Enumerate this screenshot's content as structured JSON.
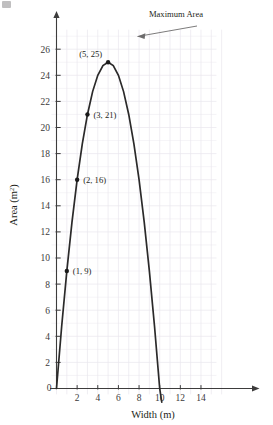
{
  "chart_data": {
    "type": "line",
    "title": "",
    "xlabel": "Width (m)",
    "ylabel": "Area (m²)",
    "ylabel_base": "Area (m",
    "ylabel_sup": "2",
    "ylabel_close": ")",
    "xlim": [
      0,
      15.5
    ],
    "ylim": [
      0,
      27.5
    ],
    "grid": true,
    "legend": "none",
    "equation": "A = -(w - 5)^2 + 25",
    "x_ticks": [
      0,
      2,
      4,
      6,
      8,
      10,
      12,
      14
    ],
    "x_tick_labels": [
      "0",
      "2",
      "4",
      "6",
      "8",
      "10",
      "12",
      "14"
    ],
    "y_ticks": [
      0,
      2,
      4,
      6,
      8,
      10,
      12,
      14,
      16,
      18,
      20,
      22,
      24,
      26
    ],
    "y_tick_labels": [
      "0",
      "2",
      "4",
      "6",
      "8",
      "10",
      "12",
      "14",
      "16",
      "18",
      "20",
      "22",
      "24",
      "26"
    ],
    "x_roots": [
      0,
      10
    ],
    "vertex": [
      5,
      25
    ],
    "series": [
      {
        "name": "Area vs Width",
        "x": [
          0,
          0.5,
          1,
          1.5,
          2,
          2.5,
          3,
          3.5,
          4,
          4.5,
          5,
          5.5,
          6,
          6.5,
          7,
          7.5,
          8,
          8.5,
          9,
          9.5,
          10,
          10.2
        ],
        "values": [
          0,
          4.75,
          9,
          12.75,
          16,
          18.75,
          21,
          22.75,
          24,
          24.75,
          25,
          24.75,
          24,
          22.75,
          21,
          18.75,
          16,
          12.75,
          9,
          4.75,
          0,
          -1.04
        ]
      }
    ],
    "marked_points": [
      {
        "x": 1,
        "y": 9,
        "label": "(1, 9)",
        "label_side": "right"
      },
      {
        "x": 2,
        "y": 16,
        "label": "(2, 16)",
        "label_side": "right"
      },
      {
        "x": 3,
        "y": 21,
        "label": "(3, 21)",
        "label_side": "right"
      },
      {
        "x": 5,
        "y": 25,
        "label": "(5, 25)",
        "label_side": "left"
      }
    ],
    "annotations": [
      {
        "text": "Maximum Area",
        "points_to": [
          5,
          25
        ],
        "arrow": true
      }
    ],
    "colors": {
      "curve": "#2b2a2a",
      "axis": "#3d3c3c",
      "grid": "#e9e6ee",
      "point": "#1a1a1a",
      "text": "#231f20",
      "background": "#ffffff",
      "annotation_line": "#6d6c6c"
    }
  }
}
